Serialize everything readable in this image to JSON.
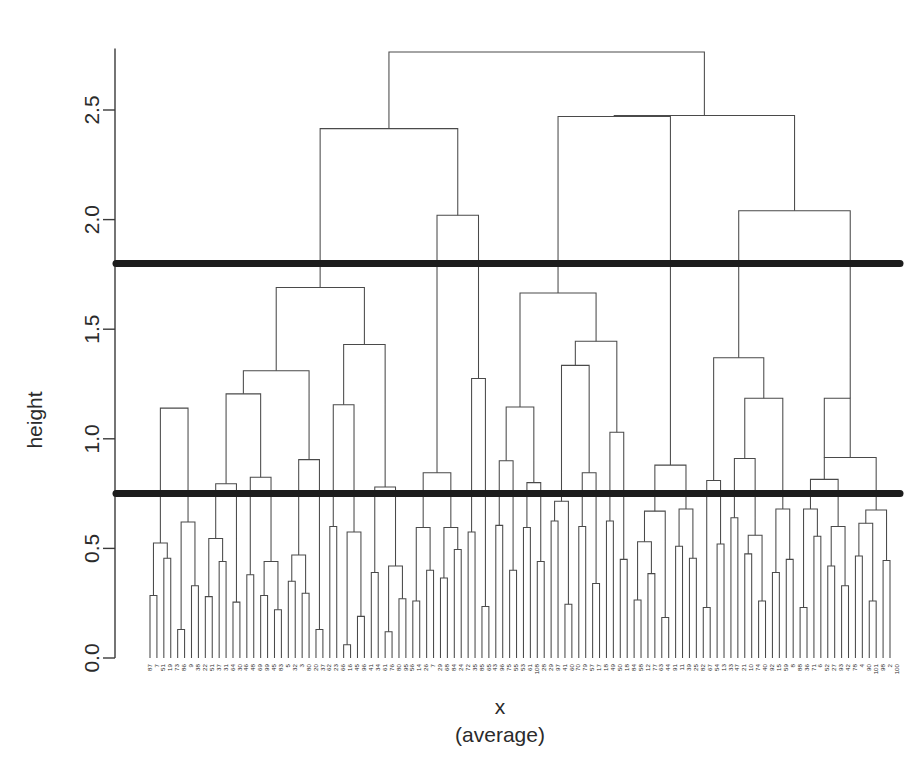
{
  "chart_data": {
    "type": "line",
    "plot_kind": "dendrogram",
    "title": "",
    "xlabel": "x",
    "xlabel_sub": "(average)",
    "ylabel": "height",
    "ylim": [
      0.0,
      2.78
    ],
    "ytick_values": [
      0.0,
      0.5,
      1.0,
      1.5,
      2.0,
      2.5
    ],
    "ytick_labels": [
      "0.0",
      "0.5",
      "1.0",
      "1.5",
      "2.0",
      "2.5"
    ],
    "grid": false,
    "legend": null,
    "linkage_method": "average",
    "n_leaves": 108,
    "cut_lines": [
      {
        "height": 1.8,
        "label": "cut-line-upper",
        "color": "#1d1d1d"
      },
      {
        "height": 0.75,
        "label": "cut-line-lower",
        "color": "#1d1d1d"
      }
    ],
    "leaf_labels": [
      "87",
      "7",
      "51",
      "19",
      "73",
      "86",
      "9",
      "38",
      "22",
      "51",
      "37",
      "31",
      "64",
      "30",
      "46",
      "48",
      "69",
      "99",
      "45",
      "83",
      "5",
      "32",
      "3",
      "80",
      "20",
      "37",
      "62",
      "23",
      "66",
      "16",
      "45",
      "96",
      "41",
      "34",
      "61",
      "76",
      "80",
      "95",
      "56",
      "14",
      "26",
      "7",
      "29",
      "68",
      "84",
      "24",
      "72",
      "35",
      "85",
      "65",
      "43",
      "96",
      "75",
      "55",
      "53",
      "61",
      "108",
      "28",
      "29",
      "97",
      "41",
      "60",
      "70",
      "79",
      "57",
      "17",
      "18",
      "49",
      "50",
      "18",
      "84",
      "58",
      "12",
      "77",
      "63",
      "44",
      "91",
      "11",
      "39",
      "25",
      "82",
      "67",
      "54",
      "13",
      "33",
      "47",
      "21",
      "10",
      "74",
      "40",
      "92",
      "15",
      "59",
      "8",
      "88",
      "36",
      "71",
      "6",
      "52",
      "27",
      "93",
      "42",
      "78",
      "4",
      "90",
      "101",
      "98",
      "2",
      "100"
    ],
    "merges": [
      {
        "x1": 0,
        "x2": 1,
        "h1": 0.0,
        "h2": 0.0,
        "h": 0.285
      },
      {
        "x1": 2,
        "x2": 3,
        "h1": 0.0,
        "h2": 0.0,
        "h": 0.455
      },
      {
        "x1": 0.5,
        "x2": 2.5,
        "h1": 0.285,
        "h2": 0.455,
        "h": 0.525
      },
      {
        "x1": 4,
        "x2": 5,
        "h1": 0.0,
        "h2": 0.0,
        "h": 0.13
      },
      {
        "x1": 6,
        "x2": 7,
        "h1": 0.0,
        "h2": 0.0,
        "h": 0.33
      },
      {
        "x1": 4.5,
        "x2": 6.5,
        "h1": 0.13,
        "h2": 0.33,
        "h": 0.62
      },
      {
        "x1": 1.5,
        "x2": 5.5,
        "h1": 0.525,
        "h2": 0.62,
        "h": 1.14
      },
      {
        "x1": 8,
        "x2": 9,
        "h1": 0.0,
        "h2": 0.0,
        "h": 0.28
      },
      {
        "x1": 10,
        "x2": 11,
        "h1": 0.0,
        "h2": 0.0,
        "h": 0.44
      },
      {
        "x1": 8.5,
        "x2": 10.5,
        "h1": 0.28,
        "h2": 0.44,
        "h": 0.545
      },
      {
        "x1": 12,
        "x2": 13,
        "h1": 0.0,
        "h2": 0.0,
        "h": 0.255
      },
      {
        "x1": 9.5,
        "x2": 12.5,
        "h1": 0.545,
        "h2": 0.255,
        "h": 0.795
      },
      {
        "x1": 14,
        "x2": 15,
        "h1": 0.0,
        "h2": 0.0,
        "h": 0.38
      },
      {
        "x1": 16,
        "x2": 17,
        "h1": 0.0,
        "h2": 0.0,
        "h": 0.285
      },
      {
        "x1": 18,
        "x2": 19,
        "h1": 0.0,
        "h2": 0.0,
        "h": 0.22
      },
      {
        "x1": 16.5,
        "x2": 18.5,
        "h1": 0.285,
        "h2": 0.22,
        "h": 0.44
      },
      {
        "x1": 14.5,
        "x2": 17.5,
        "h1": 0.38,
        "h2": 0.44,
        "h": 0.825
      },
      {
        "x1": 11,
        "x2": 16,
        "h1": 0.795,
        "h2": 0.825,
        "h": 1.205
      },
      {
        "x1": 20,
        "x2": 21,
        "h1": 0.0,
        "h2": 0.0,
        "h": 0.35
      },
      {
        "x1": 22,
        "x2": 23,
        "h1": 0.0,
        "h2": 0.0,
        "h": 0.295
      },
      {
        "x1": 20.5,
        "x2": 22.5,
        "h1": 0.35,
        "h2": 0.295,
        "h": 0.47
      },
      {
        "x1": 24,
        "x2": 25,
        "h1": 0.0,
        "h2": 0.0,
        "h": 0.13
      },
      {
        "x1": 21.5,
        "x2": 24.5,
        "h1": 0.47,
        "h2": 0.13,
        "h": 0.905
      },
      {
        "x1": 13.5,
        "x2": 23,
        "h1": 1.205,
        "h2": 0.905,
        "h": 1.31
      },
      {
        "x1": 26,
        "x2": 27,
        "h1": 0.0,
        "h2": 0.0,
        "h": 0.6
      },
      {
        "x1": 28,
        "x2": 29,
        "h1": 0.0,
        "h2": 0.0,
        "h": 0.06
      },
      {
        "x1": 30,
        "x2": 31,
        "h1": 0.0,
        "h2": 0.0,
        "h": 0.19
      },
      {
        "x1": 28.5,
        "x2": 30.5,
        "h1": 0.06,
        "h2": 0.19,
        "h": 0.575
      },
      {
        "x1": 26.5,
        "x2": 29.5,
        "h1": 0.6,
        "h2": 0.575,
        "h": 1.155
      },
      {
        "x1": 32,
        "x2": 33,
        "h1": 0.0,
        "h2": 0.0,
        "h": 0.39
      },
      {
        "x1": 34,
        "x2": 35,
        "h1": 0.0,
        "h2": 0.0,
        "h": 0.12
      },
      {
        "x1": 36,
        "x2": 37,
        "h1": 0.0,
        "h2": 0.0,
        "h": 0.27
      },
      {
        "x1": 34.5,
        "x2": 36.5,
        "h1": 0.12,
        "h2": 0.27,
        "h": 0.42
      },
      {
        "x1": 32.5,
        "x2": 35.5,
        "h1": 0.39,
        "h2": 0.42,
        "h": 0.78
      },
      {
        "x1": 28,
        "x2": 34,
        "h1": 1.155,
        "h2": 0.78,
        "h": 1.43
      },
      {
        "x1": 18.25,
        "x2": 31,
        "h1": 1.31,
        "h2": 1.43,
        "h": 1.69
      },
      {
        "x1": 38,
        "x2": 39,
        "h1": 0.0,
        "h2": 0.0,
        "h": 0.26
      },
      {
        "x1": 40,
        "x2": 41,
        "h1": 0.0,
        "h2": 0.0,
        "h": 0.4
      },
      {
        "x1": 38.5,
        "x2": 40.5,
        "h1": 0.26,
        "h2": 0.4,
        "h": 0.595
      },
      {
        "x1": 42,
        "x2": 43,
        "h1": 0.0,
        "h2": 0.0,
        "h": 0.365
      },
      {
        "x1": 44,
        "x2": 45,
        "h1": 0.0,
        "h2": 0.0,
        "h": 0.495
      },
      {
        "x1": 42.5,
        "x2": 44.5,
        "h1": 0.365,
        "h2": 0.495,
        "h": 0.595
      },
      {
        "x1": 39.5,
        "x2": 43.5,
        "h1": 0.595,
        "h2": 0.595,
        "h": 0.845
      },
      {
        "x1": 46,
        "x2": 47,
        "h1": 0.0,
        "h2": 0.0,
        "h": 0.575
      },
      {
        "x1": 48,
        "x2": 49,
        "h1": 0.0,
        "h2": 0.0,
        "h": 0.235
      },
      {
        "x1": 46.5,
        "x2": 48.5,
        "h1": 0.575,
        "h2": 0.235,
        "h": 1.275
      },
      {
        "x1": 41.5,
        "x2": 47.5,
        "h1": 0.845,
        "h2": 1.275,
        "h": 2.02
      },
      {
        "x1": 24.6,
        "x2": 44.5,
        "h1": 1.69,
        "h2": 2.02,
        "h": 2.415
      },
      {
        "x1": 50,
        "x2": 51,
        "h1": 0.0,
        "h2": 0.0,
        "h": 0.605
      },
      {
        "x1": 52,
        "x2": 53,
        "h1": 0.0,
        "h2": 0.0,
        "h": 0.4
      },
      {
        "x1": 50.5,
        "x2": 52.5,
        "h1": 0.605,
        "h2": 0.4,
        "h": 0.9
      },
      {
        "x1": 54,
        "x2": 55,
        "h1": 0.0,
        "h2": 0.0,
        "h": 0.595
      },
      {
        "x1": 56,
        "x2": 57,
        "h1": 0.0,
        "h2": 0.0,
        "h": 0.44
      },
      {
        "x1": 54.5,
        "x2": 56.5,
        "h1": 0.595,
        "h2": 0.44,
        "h": 0.8
      },
      {
        "x1": 51.5,
        "x2": 55.5,
        "h1": 0.9,
        "h2": 0.8,
        "h": 1.145
      },
      {
        "x1": 58,
        "x2": 59,
        "h1": 0.0,
        "h2": 0.0,
        "h": 0.625
      },
      {
        "x1": 60,
        "x2": 61,
        "h1": 0.0,
        "h2": 0.0,
        "h": 0.245
      },
      {
        "x1": 58.5,
        "x2": 60.5,
        "h1": 0.625,
        "h2": 0.245,
        "h": 0.715
      },
      {
        "x1": 62,
        "x2": 63,
        "h1": 0.0,
        "h2": 0.0,
        "h": 0.6
      },
      {
        "x1": 64,
        "x2": 65,
        "h1": 0.0,
        "h2": 0.0,
        "h": 0.34
      },
      {
        "x1": 62.5,
        "x2": 64.5,
        "h1": 0.6,
        "h2": 0.34,
        "h": 0.845
      },
      {
        "x1": 59.5,
        "x2": 63.5,
        "h1": 0.715,
        "h2": 0.845,
        "h": 1.335
      },
      {
        "x1": 66,
        "x2": 67,
        "h1": 0.0,
        "h2": 0.0,
        "h": 0.625
      },
      {
        "x1": 68,
        "x2": 69,
        "h1": 0.0,
        "h2": 0.0,
        "h": 0.45
      },
      {
        "x1": 66.5,
        "x2": 68.5,
        "h1": 0.625,
        "h2": 0.45,
        "h": 1.03
      },
      {
        "x1": 61.5,
        "x2": 67.5,
        "h1": 1.335,
        "h2": 1.03,
        "h": 1.445
      },
      {
        "x1": 53.5,
        "x2": 64.5,
        "h1": 1.145,
        "h2": 1.445,
        "h": 1.665
      },
      {
        "x1": 70,
        "x2": 71,
        "h1": 0.0,
        "h2": 0.0,
        "h": 0.265
      },
      {
        "x1": 72,
        "x2": 73,
        "h1": 0.0,
        "h2": 0.0,
        "h": 0.385
      },
      {
        "x1": 70.5,
        "x2": 72.5,
        "h1": 0.265,
        "h2": 0.385,
        "h": 0.53
      },
      {
        "x1": 74,
        "x2": 75,
        "h1": 0.0,
        "h2": 0.0,
        "h": 0.185
      },
      {
        "x1": 71.5,
        "x2": 74.5,
        "h1": 0.53,
        "h2": 0.185,
        "h": 0.67
      },
      {
        "x1": 76,
        "x2": 77,
        "h1": 0.0,
        "h2": 0.0,
        "h": 0.51
      },
      {
        "x1": 78,
        "x2": 79,
        "h1": 0.0,
        "h2": 0.0,
        "h": 0.455
      },
      {
        "x1": 76.5,
        "x2": 78.5,
        "h1": 0.51,
        "h2": 0.455,
        "h": 0.68
      },
      {
        "x1": 73,
        "x2": 77.5,
        "h1": 0.67,
        "h2": 0.68,
        "h": 0.88
      },
      {
        "x1": 59,
        "x2": 75.25,
        "h1": 1.665,
        "h2": 0.88,
        "h": 2.47
      },
      {
        "x1": 80,
        "x2": 81,
        "h1": 0.0,
        "h2": 0.0,
        "h": 0.23
      },
      {
        "x1": 82,
        "x2": 83,
        "h1": 0.0,
        "h2": 0.0,
        "h": 0.52
      },
      {
        "x1": 80.5,
        "x2": 82.5,
        "h1": 0.23,
        "h2": 0.52,
        "h": 0.81
      },
      {
        "x1": 84,
        "x2": 85,
        "h1": 0.0,
        "h2": 0.0,
        "h": 0.64
      },
      {
        "x1": 86,
        "x2": 87,
        "h1": 0.0,
        "h2": 0.0,
        "h": 0.475
      },
      {
        "x1": 88,
        "x2": 89,
        "h1": 0.0,
        "h2": 0.0,
        "h": 0.26
      },
      {
        "x1": 86.5,
        "x2": 88.5,
        "h1": 0.475,
        "h2": 0.26,
        "h": 0.56
      },
      {
        "x1": 84.5,
        "x2": 87.5,
        "h1": 0.64,
        "h2": 0.56,
        "h": 0.91
      },
      {
        "x1": 90,
        "x2": 91,
        "h1": 0.0,
        "h2": 0.0,
        "h": 0.39
      },
      {
        "x1": 92,
        "x2": 93,
        "h1": 0.0,
        "h2": 0.0,
        "h": 0.45
      },
      {
        "x1": 90.5,
        "x2": 92.5,
        "h1": 0.39,
        "h2": 0.45,
        "h": 0.68
      },
      {
        "x1": 86,
        "x2": 91.5,
        "h1": 0.91,
        "h2": 0.68,
        "h": 1.185
      },
      {
        "x1": 81.5,
        "x2": 88.75,
        "h1": 0.81,
        "h2": 1.185,
        "h": 1.37
      },
      {
        "x1": 94,
        "x2": 95,
        "h1": 0.0,
        "h2": 0.0,
        "h": 0.23
      },
      {
        "x1": 96,
        "x2": 97,
        "h1": 0.0,
        "h2": 0.0,
        "h": 0.555
      },
      {
        "x1": 94.5,
        "x2": 96.5,
        "h1": 0.23,
        "h2": 0.555,
        "h": 0.68
      },
      {
        "x1": 98,
        "x2": 99,
        "h1": 0.0,
        "h2": 0.0,
        "h": 0.42
      },
      {
        "x1": 100,
        "x2": 101,
        "h1": 0.0,
        "h2": 0.0,
        "h": 0.33
      },
      {
        "x1": 98.5,
        "x2": 100.5,
        "h1": 0.42,
        "h2": 0.33,
        "h": 0.6
      },
      {
        "x1": 95.5,
        "x2": 99.5,
        "h1": 0.68,
        "h2": 0.6,
        "h": 0.815
      },
      {
        "x1": 102,
        "x2": 103,
        "h1": 0.0,
        "h2": 0.0,
        "h": 0.465
      },
      {
        "x1": 104,
        "x2": 105,
        "h1": 0.0,
        "h2": 0.0,
        "h": 0.26
      },
      {
        "x1": 102.5,
        "x2": 104.5,
        "h1": 0.465,
        "h2": 0.26,
        "h": 0.615
      },
      {
        "x1": 106,
        "x2": 107,
        "h1": 0.0,
        "h2": 0.0,
        "h": 0.445
      },
      {
        "x1": 103.5,
        "x2": 106.5,
        "h1": 0.615,
        "h2": 0.445,
        "h": 0.675
      },
      {
        "x1": 97.5,
        "x2": 105,
        "h1": 0.815,
        "h2": 0.675,
        "h": 0.915
      },
      {
        "x1": 101.25,
        "x2": 97.5,
        "h1": 0.915,
        "h2": 0.915,
        "h": 1.185
      },
      {
        "x1": 85.125,
        "x2": 101.25,
        "h1": 1.37,
        "h2": 1.185,
        "h": 2.04
      },
      {
        "x1": 67.125,
        "x2": 93.2,
        "h1": 2.47,
        "h2": 2.04,
        "h": 2.475
      },
      {
        "x1": 34.55,
        "x2": 80.16,
        "h1": 2.415,
        "h2": 2.475,
        "h": 2.765
      }
    ]
  },
  "plot_geometry": {
    "axis_x": 115,
    "plot_left": 150,
    "plot_right": 890,
    "y_zero": 658,
    "y_top_tick": 110,
    "top_tick_value": 2.5
  },
  "axis_titles": {
    "y": "height",
    "x_main": "x",
    "x_sub": "(average)"
  }
}
